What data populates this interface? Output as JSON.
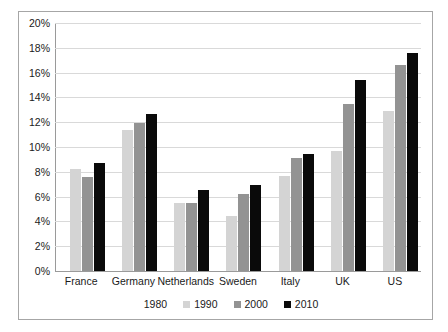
{
  "chart_data": {
    "type": "bar",
    "title": "",
    "xlabel": "",
    "ylabel": "",
    "ylim": [
      0,
      20
    ],
    "ytick_step": 2,
    "yticks": [
      "0%",
      "2%",
      "4%",
      "6%",
      "8%",
      "10%",
      "12%",
      "14%",
      "16%",
      "18%",
      "20%"
    ],
    "grid": true,
    "legend_position": "bottom-center",
    "categories": [
      "France",
      "Germany",
      "Netherlands",
      "Sweden",
      "Italy",
      "UK",
      "US"
    ],
    "series": [
      {
        "name": "1980",
        "color": "#ffffff",
        "values": [
          0,
          0,
          0,
          0,
          0,
          0,
          0
        ]
      },
      {
        "name": "1990",
        "color": "#d4d4d4",
        "values": [
          8.2,
          11.4,
          5.5,
          4.4,
          7.7,
          9.7,
          12.9
        ]
      },
      {
        "name": "2000",
        "color": "#939393",
        "values": [
          7.6,
          11.9,
          5.5,
          6.2,
          9.1,
          13.5,
          16.6
        ]
      },
      {
        "name": "2010",
        "color": "#0a0a0a",
        "values": [
          8.7,
          12.7,
          6.5,
          6.9,
          9.4,
          15.4,
          17.6
        ]
      }
    ]
  },
  "axis": {
    "unit_suffix": "%"
  },
  "colors": {
    "frame_border": "#a6a6a6",
    "gridline": "#d9d9d9",
    "axis_line": "#9a9a9a",
    "text": "#1a1a1a"
  }
}
